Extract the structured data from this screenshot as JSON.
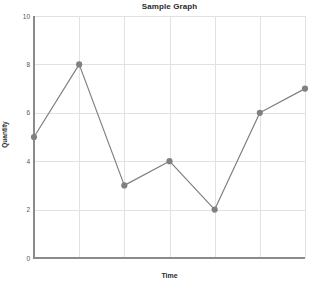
{
  "chart_data": {
    "type": "line",
    "title": "Sample Graph",
    "xlabel": "Time",
    "ylabel": "Quantity",
    "x": [
      0,
      1,
      2,
      3,
      4,
      5,
      6
    ],
    "values": [
      5,
      8,
      3,
      4,
      2,
      6,
      7
    ],
    "series": [
      {
        "name": "Quantity",
        "values": [
          5,
          8,
          3,
          4,
          2,
          6,
          7
        ]
      }
    ],
    "categories": [
      "",
      "",
      "",
      "",
      "",
      "",
      ""
    ],
    "xlim": [
      0,
      6
    ],
    "ylim": [
      0,
      10
    ],
    "ytick_labels": [
      "0",
      "2",
      "4",
      "6",
      "8",
      "10"
    ],
    "ytick_values": [
      0,
      2,
      4,
      6,
      8,
      10
    ],
    "xtick_labels": [],
    "grid": true,
    "legend": false,
    "legend_position": "none",
    "colors": {
      "line": "#808080",
      "marker": "#808080",
      "grid": "#e2e2e2",
      "axis": "#8b8b8b",
      "text": "#2b2b2b",
      "tick_text": "#555555",
      "background": "#ffffff"
    }
  }
}
